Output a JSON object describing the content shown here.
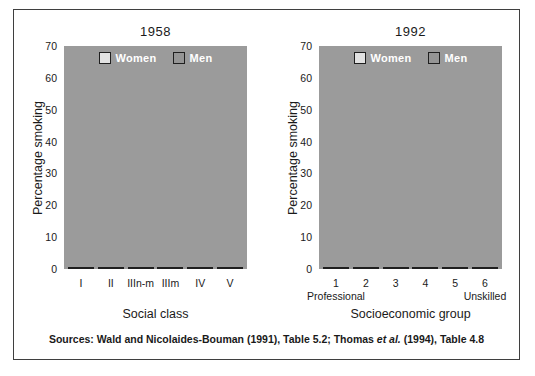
{
  "colors": {
    "plot_background": "#9b9b9b",
    "women_bar": "#e2e2e2",
    "men_bar": "#959595",
    "bar_outline": "#1f1f1f",
    "frame_border": "#3f3f3f",
    "legend_text": "#ffffff",
    "text": "#1a1a1a",
    "page_background": "#ffffff"
  },
  "source_note": {
    "prefix": "Sources: Wald and Nicolaides-Bouman (1991), Table 5.2; Thomas ",
    "italic": "et al.",
    "suffix": " (1994), Table 4.8"
  },
  "chart_data": [
    {
      "type": "bar",
      "title": "1958",
      "xlabel": "Social class",
      "ylabel": "Percentage smoking",
      "categories": [
        "I",
        "II",
        "IIIn-m",
        "IIIm",
        "IV",
        "V"
      ],
      "series": [
        {
          "name": "Women",
          "values": [
            42,
            42,
            41,
            41,
            41,
            41
          ]
        },
        {
          "name": "Men",
          "values": [
            54,
            58,
            60,
            60,
            54,
            61
          ]
        }
      ],
      "ylim": [
        0,
        70
      ],
      "yticks": [
        0,
        10,
        20,
        30,
        40,
        50,
        60,
        70
      ],
      "grid": false,
      "legend_position": "top-center"
    },
    {
      "type": "bar",
      "title": "1992",
      "xlabel": "Socioeconomic group",
      "ylabel": "Percentage smoking",
      "categories": [
        "1",
        "2",
        "3",
        "4",
        "5",
        "6"
      ],
      "category_sublabels": [
        "Professional",
        "",
        "",
        "",
        "",
        "Unskilled"
      ],
      "series": [
        {
          "name": "Women",
          "values": [
            13,
            22,
            28,
            32,
            34,
            34
          ]
        },
        {
          "name": "Men",
          "values": [
            14,
            23,
            26,
            34,
            39,
            42
          ]
        }
      ],
      "ylim": [
        0,
        70
      ],
      "yticks": [
        0,
        10,
        20,
        30,
        40,
        50,
        60,
        70
      ],
      "grid": false,
      "legend_position": "top-center"
    }
  ]
}
